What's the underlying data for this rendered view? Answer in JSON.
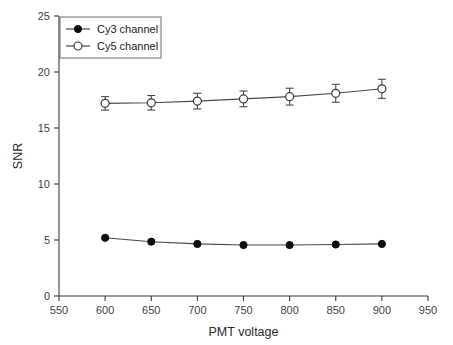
{
  "chart_data": {
    "type": "line",
    "title": "",
    "xlabel": "PMT voltage",
    "ylabel": "SNR",
    "xlim": [
      550,
      950
    ],
    "ylim": [
      0,
      25
    ],
    "xticks": [
      550,
      600,
      650,
      700,
      750,
      800,
      850,
      900,
      950
    ],
    "xtick_labels": [
      "550",
      "600",
      "650",
      "700",
      "750",
      "800",
      "850",
      "900",
      "950"
    ],
    "yticks": [
      0,
      5,
      10,
      15,
      20,
      25
    ],
    "ytick_labels": [
      "0",
      "5",
      "10",
      "15",
      "20",
      "25"
    ],
    "grid": false,
    "legend_position": "upper left",
    "x": [
      600,
      650,
      700,
      750,
      800,
      850,
      900
    ],
    "series": [
      {
        "name": "Cy3 channel",
        "marker": "filled-circle",
        "values": [
          5.2,
          4.85,
          4.65,
          4.55,
          4.55,
          4.6,
          4.65
        ],
        "errors": [
          0.12,
          0.1,
          0.1,
          0.1,
          0.1,
          0.1,
          0.1
        ]
      },
      {
        "name": "Cy5 channel",
        "marker": "open-circle",
        "values": [
          17.2,
          17.25,
          17.4,
          17.6,
          17.8,
          18.1,
          18.5
        ],
        "errors": [
          0.6,
          0.65,
          0.7,
          0.7,
          0.75,
          0.8,
          0.85
        ]
      }
    ]
  },
  "legend": {
    "entries": [
      {
        "label": "Cy3 channel",
        "marker": "filled-circle"
      },
      {
        "label": "Cy5 channel",
        "marker": "open-circle"
      }
    ]
  },
  "colors": {
    "axis": "#3a3a3a",
    "line": "#4a4a4a",
    "cy3_marker": "#0d0d0d",
    "cy5_marker": "#ffffff",
    "background": "#ffffff"
  }
}
